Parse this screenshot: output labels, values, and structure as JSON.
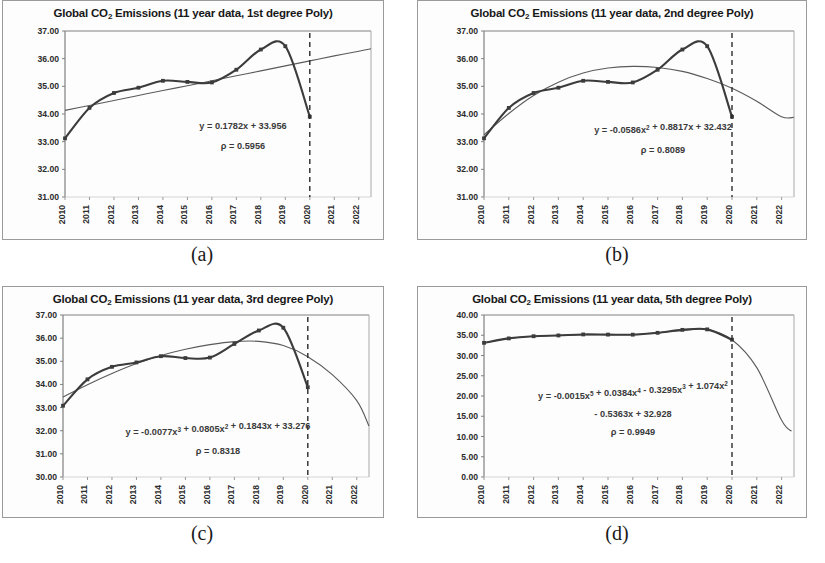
{
  "figure": {
    "panels": [
      {
        "id": "a",
        "caption": "(a)",
        "title_prefix": "Global CO",
        "title_sub": "2",
        "title_suffix": " Emissions (11 year data, 1st degree Poly)",
        "title_full": "Global CO2 Emissions (11 year data, 1st degree Poly)",
        "equation_lines": [
          [
            {
              "t": "y = 0.1782x + 33.956"
            }
          ],
          [
            {
              "t": "ρ = 0.5956"
            }
          ]
        ],
        "chart_data": {
          "type": "line",
          "title": "Global CO2 Emissions (11 year data, 1st degree Poly)",
          "xlabel": "",
          "ylabel": "",
          "grid": false,
          "legend": "none",
          "xlim": [
            2010,
            2022.5
          ],
          "ylim": [
            31.0,
            37.0
          ],
          "ytick_labels": [
            "37.00",
            "36.00",
            "35.00",
            "34.00",
            "33.00",
            "32.00",
            "31.00"
          ],
          "ytick_values": [
            37.0,
            36.0,
            35.0,
            34.0,
            33.0,
            32.0,
            31.0
          ],
          "xtick_labels": [
            "2010",
            "2011",
            "2012",
            "2013",
            "2014",
            "2015",
            "2016",
            "2017",
            "2018",
            "2019",
            "2020",
            "2021",
            "2022"
          ],
          "xtick_values": [
            2010,
            2011,
            2012,
            2013,
            2014,
            2015,
            2016,
            2017,
            2018,
            2019,
            2020,
            2021,
            2022
          ],
          "series": [
            {
              "name": "Global CO2 emissions (observed)",
              "style": "line-with-markers",
              "x": [
                2010,
                2011,
                2012,
                2013,
                2014,
                2015,
                2016,
                2017,
                2018,
                2019,
                2020
              ],
              "values": [
                33.12,
                34.22,
                34.76,
                34.95,
                35.2,
                35.16,
                35.14,
                35.6,
                36.33,
                36.45,
                33.9
              ]
            },
            {
              "name": "1st degree polynomial fit",
              "style": "smooth-trend",
              "equation": "y = 0.1782x + 33.956",
              "rho": 0.5956,
              "coefficients": [
                0.1782,
                33.956
              ],
              "x": [
                2010,
                2011,
                2012,
                2013,
                2014,
                2015,
                2016,
                2017,
                2018,
                2019,
                2020,
                2021,
                2022,
                2022.5
              ],
              "values": [
                34.13,
                34.31,
                34.49,
                34.67,
                34.85,
                35.02,
                35.2,
                35.38,
                35.56,
                35.74,
                35.92,
                36.1,
                36.27,
                36.36
              ]
            }
          ],
          "annotations": [
            {
              "type": "vertical-dashed-line",
              "x": 2020,
              "label": "2020 marker"
            }
          ]
        }
      },
      {
        "id": "b",
        "caption": "(b)",
        "title_prefix": "Global CO",
        "title_sub": "2",
        "title_suffix": " Emissions (11 year data, 2nd degree Poly)",
        "title_full": "Global CO2 Emissions (11 year data, 2nd degree Poly)",
        "equation_lines": [
          [
            {
              "t": "y = -0.0586x"
            },
            {
              "t": "2",
              "sup": true
            },
            {
              "t": " + 0.8817x + 32.432"
            }
          ],
          [
            {
              "t": "ρ = 0.8089"
            }
          ]
        ],
        "chart_data": {
          "type": "line",
          "title": "Global CO2 Emissions (11 year data, 2nd degree Poly)",
          "xlabel": "",
          "ylabel": "",
          "grid": false,
          "legend": "none",
          "xlim": [
            2010,
            2022.5
          ],
          "ylim": [
            31.0,
            37.0
          ],
          "ytick_labels": [
            "37.00",
            "36.00",
            "35.00",
            "34.00",
            "33.00",
            "32.00",
            "31.00"
          ],
          "ytick_values": [
            37.0,
            36.0,
            35.0,
            34.0,
            33.0,
            32.0,
            31.0
          ],
          "xtick_labels": [
            "2010",
            "2011",
            "2012",
            "2013",
            "2014",
            "2015",
            "2016",
            "2017",
            "2018",
            "2019",
            "2020",
            "2021",
            "2022"
          ],
          "xtick_values": [
            2010,
            2011,
            2012,
            2013,
            2014,
            2015,
            2016,
            2017,
            2018,
            2019,
            2020,
            2021,
            2022
          ],
          "series": [
            {
              "name": "Global CO2 emissions (observed)",
              "style": "line-with-markers",
              "x": [
                2010,
                2011,
                2012,
                2013,
                2014,
                2015,
                2016,
                2017,
                2018,
                2019,
                2020
              ],
              "values": [
                33.12,
                34.22,
                34.76,
                34.95,
                35.2,
                35.16,
                35.14,
                35.6,
                36.33,
                36.45,
                33.9
              ]
            },
            {
              "name": "2nd degree polynomial fit",
              "style": "smooth-trend",
              "equation": "y = -0.0586x^2 + 0.8817x + 32.432",
              "rho": 0.8089,
              "coefficients": [
                -0.0586,
                0.8817,
                32.432
              ],
              "x": [
                2010,
                2011,
                2012,
                2013,
                2014,
                2015,
                2016,
                2017,
                2018,
                2019,
                2020,
                2021,
                2022,
                2022.5
              ],
              "values": [
                33.25,
                34.02,
                34.67,
                35.15,
                35.48,
                35.66,
                35.72,
                35.68,
                35.54,
                35.28,
                34.93,
                34.46,
                33.9,
                33.88
              ]
            }
          ],
          "annotations": [
            {
              "type": "vertical-dashed-line",
              "x": 2020,
              "label": "2020 marker"
            }
          ]
        }
      },
      {
        "id": "c",
        "caption": "(c)",
        "title_prefix": "Global CO",
        "title_sub": "2",
        "title_suffix": " Emissions (11 year data, 3rd degree Poly)",
        "title_full": "Global CO2 Emissions (11 year data, 3rd degree Poly)",
        "equation_lines": [
          [
            {
              "t": "y = -0.0077x"
            },
            {
              "t": "3",
              "sup": true
            },
            {
              "t": " + 0.0805x"
            },
            {
              "t": "2",
              "sup": true
            },
            {
              "t": " + 0.1843x + 33.276"
            }
          ],
          [
            {
              "t": "ρ = 0.8318"
            }
          ]
        ],
        "chart_data": {
          "type": "line",
          "title": "Global CO2 Emissions (11 year data, 3rd degree Poly)",
          "xlabel": "",
          "ylabel": "",
          "grid": false,
          "legend": "none",
          "xlim": [
            2010,
            2022.5
          ],
          "ylim": [
            30.0,
            37.0
          ],
          "ytick_labels": [
            "37.00",
            "36.00",
            "35.00",
            "34.00",
            "33.00",
            "32.00",
            "31.00",
            "30.00"
          ],
          "ytick_values": [
            37.0,
            36.0,
            35.0,
            34.0,
            33.0,
            32.0,
            31.0,
            30.0
          ],
          "xtick_labels": [
            "2010",
            "2011",
            "2012",
            "2013",
            "2014",
            "2015",
            "2016",
            "2017",
            "2018",
            "2019",
            "2020",
            "2021",
            "2022"
          ],
          "xtick_values": [
            2010,
            2011,
            2012,
            2013,
            2014,
            2015,
            2016,
            2017,
            2018,
            2019,
            2020,
            2021,
            2022
          ],
          "series": [
            {
              "name": "Global CO2 emissions (observed)",
              "style": "line-with-markers",
              "x": [
                2010,
                2011,
                2012,
                2013,
                2014,
                2015,
                2016,
                2017,
                2018,
                2019,
                2020
              ],
              "values": [
                33.08,
                34.22,
                34.76,
                34.95,
                35.22,
                35.14,
                35.16,
                35.75,
                36.33,
                36.45,
                33.88
              ]
            },
            {
              "name": "3rd degree polynomial fit",
              "style": "smooth-trend",
              "equation": "y = -0.0077x^3 + 0.0805x^2 + 0.1843x + 33.276",
              "rho": 0.8318,
              "coefficients": [
                -0.0077,
                0.0805,
                0.1843,
                33.276
              ],
              "x": [
                2010,
                2011,
                2012,
                2013,
                2014,
                2015,
                2016,
                2017,
                2018,
                2019,
                2020,
                2021,
                2022,
                2022.5
              ],
              "values": [
                33.46,
                33.99,
                34.47,
                34.9,
                35.25,
                35.52,
                35.72,
                35.85,
                35.86,
                35.68,
                35.2,
                34.42,
                33.3,
                32.2
              ]
            }
          ],
          "annotations": [
            {
              "type": "vertical-dashed-line",
              "x": 2020,
              "label": "2020 marker"
            }
          ]
        }
      },
      {
        "id": "d",
        "caption": "(d)",
        "title_prefix": "Global CO",
        "title_sub": "2",
        "title_suffix": " Emissions (11 year data, 5th degree Poly)",
        "title_full": "Global CO2 Emissions (11 year data, 5th degree Poly)",
        "equation_lines": [
          [
            {
              "t": "y = -0.0015x"
            },
            {
              "t": "5",
              "sup": true
            },
            {
              "t": " + 0.0384x"
            },
            {
              "t": "4",
              "sup": true
            },
            {
              "t": " - 0.3295x"
            },
            {
              "t": "3",
              "sup": true
            },
            {
              "t": " + 1.074x"
            },
            {
              "t": "2",
              "sup": true
            }
          ],
          [
            {
              "t": "- 0.5363x + 32.928"
            }
          ],
          [
            {
              "t": "ρ = 0.9949"
            }
          ]
        ],
        "chart_data": {
          "type": "line",
          "title": "Global CO2 Emissions (11 year data, 5th degree Poly)",
          "xlabel": "",
          "ylabel": "",
          "grid": false,
          "legend": "none",
          "xlim": [
            2010,
            2022.5
          ],
          "ylim": [
            0.0,
            40.0
          ],
          "ytick_labels": [
            "40.00",
            "35.00",
            "30.00",
            "25.00",
            "20.00",
            "15.00",
            "10.00",
            "5.00",
            "0.00"
          ],
          "ytick_values": [
            40.0,
            35.0,
            30.0,
            25.0,
            20.0,
            15.0,
            10.0,
            5.0,
            0.0
          ],
          "xtick_labels": [
            "2010",
            "2011",
            "2012",
            "2013",
            "2014",
            "2015",
            "2016",
            "2017",
            "2018",
            "2019",
            "2020",
            "2021",
            "2022"
          ],
          "xtick_values": [
            2010,
            2011,
            2012,
            2013,
            2014,
            2015,
            2016,
            2017,
            2018,
            2019,
            2020,
            2021,
            2022
          ],
          "series": [
            {
              "name": "Global CO2 emissions (observed)",
              "style": "line-with-markers",
              "x": [
                2010,
                2011,
                2012,
                2013,
                2014,
                2015,
                2016,
                2017,
                2018,
                2019,
                2020
              ],
              "values": [
                33.12,
                34.22,
                34.76,
                34.95,
                35.2,
                35.16,
                35.14,
                35.6,
                36.33,
                36.45,
                33.9
              ]
            },
            {
              "name": "5th degree polynomial fit",
              "style": "smooth-trend",
              "equation": "y = -0.0015x^5 + 0.0384x^4 - 0.3295x^3 + 1.074x^2 - 0.5363x + 32.928",
              "rho": 0.9949,
              "coefficients": [
                -0.0015,
                0.0384,
                -0.3295,
                1.074,
                -0.5363,
                32.928
              ],
              "x": [
                2010,
                2011,
                2012,
                2013,
                2014,
                2015,
                2016,
                2017,
                2018,
                2019,
                2020,
                2021,
                2022,
                2022.4
              ],
              "values": [
                33.1,
                34.2,
                34.75,
                34.98,
                35.15,
                35.15,
                35.18,
                35.62,
                36.2,
                36.42,
                33.9,
                27.0,
                14.0,
                11.3
              ]
            }
          ],
          "annotations": [
            {
              "type": "vertical-dashed-line",
              "x": 2020,
              "label": "2020 marker"
            }
          ]
        }
      }
    ]
  }
}
